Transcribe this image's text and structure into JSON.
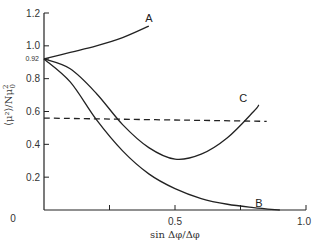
{
  "chart_data": {
    "type": "line",
    "title": "",
    "xlabel": "sin Δφ/Δφ",
    "ylabel": "⟨μ²⟩/Nμ₀²",
    "xlim": [
      0,
      1.0
    ],
    "ylim": [
      0,
      1.2
    ],
    "x_ticks": [
      0,
      0.25,
      0.5,
      0.75,
      1.0
    ],
    "x_tick_labels": [
      "0",
      "",
      "0.5",
      "",
      "1.0"
    ],
    "y_ticks": [
      0,
      0.2,
      0.4,
      0.6,
      0.8,
      0.92,
      1.0,
      1.2
    ],
    "y_tick_labels": [
      "0",
      "0.2",
      "0.4",
      "0.6",
      "0.8",
      "0.92",
      "1.0",
      "1.2"
    ],
    "grid": false,
    "legend": "inline labels",
    "series": [
      {
        "name": "A",
        "style": "solid",
        "x": [
          0,
          0.1,
          0.2,
          0.3,
          0.4
        ],
        "y": [
          0.92,
          0.96,
          1.0,
          1.05,
          1.12
        ]
      },
      {
        "name": "C",
        "style": "solid",
        "x": [
          0,
          0.1,
          0.2,
          0.3,
          0.4,
          0.5,
          0.6,
          0.7,
          0.8,
          0.82
        ],
        "y": [
          0.92,
          0.86,
          0.71,
          0.52,
          0.38,
          0.31,
          0.34,
          0.44,
          0.6,
          0.64
        ]
      },
      {
        "name": "B",
        "style": "solid",
        "x": [
          0,
          0.1,
          0.2,
          0.3,
          0.4,
          0.5,
          0.6,
          0.7,
          0.8,
          0.9
        ],
        "y": [
          0.92,
          0.78,
          0.55,
          0.36,
          0.22,
          0.13,
          0.07,
          0.035,
          0.015,
          0.0
        ]
      },
      {
        "name": "reference (dashed)",
        "style": "dashed",
        "x": [
          0,
          0.85
        ],
        "y": [
          0.56,
          0.54
        ]
      }
    ],
    "annotations": [
      {
        "text": "A",
        "x": 0.4,
        "y": 1.17
      },
      {
        "text": "C",
        "x": 0.76,
        "y": 0.68
      },
      {
        "text": "B",
        "x": 0.82,
        "y": 0.04
      }
    ]
  },
  "labels": {
    "x_axis": "sin Δφ/Δφ",
    "y_axis_main": "⟨μ²⟩/Nμ",
    "y_axis_sub": "0",
    "y_axis_sup": "2",
    "curve_a": "A",
    "curve_b": "B",
    "curve_c": "C"
  }
}
